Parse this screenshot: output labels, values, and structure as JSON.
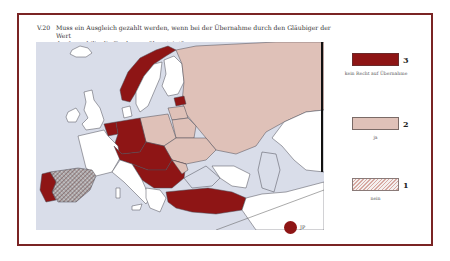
{
  "figure": {
    "number": "V.20",
    "title_line1": "Muss ein Ausgleich gezahlt werden, wenn bei der Übernahme durch den Gläubiger der Wert",
    "title_line2": "der Immobilie die Forderung übersteigt?"
  },
  "legend": {
    "items": [
      {
        "value": "3",
        "label": "kein Recht auf Übernahme",
        "color": "#8e1515",
        "pattern": "solid"
      },
      {
        "value": "2",
        "label": "ja",
        "color": "#dfc1b8",
        "pattern": "solid"
      },
      {
        "value": "1",
        "label": "nein",
        "color": "#d7a9a2",
        "pattern": "hatched"
      }
    ]
  },
  "inset": {
    "label": "JP",
    "color": "#8e1515"
  },
  "map": {
    "sea_color": "#d9dde9",
    "no_data_color": "#ffffff",
    "frame_color": "#7a2424",
    "regions": {
      "category_3": [
        "Norway",
        "Germany",
        "Austria",
        "Czech Republic",
        "Slovakia",
        "Hungary",
        "Slovenia",
        "Croatia",
        "Serbia",
        "Bulgaria",
        "Romania",
        "Switzerland",
        "Netherlands",
        "Portugal",
        "Turkey",
        "Estonia"
      ],
      "category_2": [
        "Russia",
        "Poland",
        "Belarus",
        "Ukraine",
        "Moldova",
        "Lithuania",
        "Latvia"
      ],
      "category_1": [
        "Spain"
      ]
    }
  }
}
